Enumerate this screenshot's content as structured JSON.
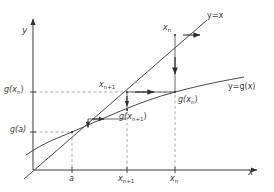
{
  "figure": {
    "type": "cobweb-diagram",
    "axes": {
      "x_axis_label": "x",
      "y_axis_label": "y",
      "origin": {
        "x": 33,
        "y": 170
      },
      "x_axis_end": {
        "x": 262,
        "y": 170
      },
      "y_axis_end": {
        "x": 33,
        "y": 14
      }
    },
    "curves": [
      {
        "name": "identity-line",
        "label": "y=x",
        "label_position": {
          "x": 211,
          "y": 13
        },
        "from": {
          "x": 24,
          "y": 179
        },
        "to": {
          "x": 206,
          "y": 21
        },
        "style": "solid"
      },
      {
        "name": "g-curve",
        "label": "y=g(x)",
        "label_position": {
          "x": 229,
          "y": 84
        },
        "style": "solid-curved"
      }
    ],
    "points": [
      {
        "name": "fixed-point-a",
        "x": 72,
        "y": 132
      },
      {
        "name": "point-xn-on-identity",
        "x": 175,
        "y": 35
      },
      {
        "name": "point-xn-plus-1-on-identity",
        "x": 127,
        "y": 92
      },
      {
        "name": "point-g-xn",
        "x": 175,
        "y": 92
      },
      {
        "name": "point-g-xn-plus-1",
        "x": 127,
        "y": 110
      }
    ],
    "labels": {
      "y_axis": "y",
      "x_axis": "x",
      "g_xn_on_y_axis": "g(x",
      "g_xn_on_y_axis_sub": "n",
      "g_xn_on_y_axis_tail": ")",
      "g_a_on_y_axis": "g(a)",
      "a_on_x_axis": "a",
      "x_n_plus_1_on_x_axis": "x",
      "x_n_plus_1_on_x_axis_sub": "n+1",
      "x_n_on_x_axis": "x",
      "x_n_on_x_axis_sub": "n",
      "x_n_top": "x",
      "x_n_top_sub": "n",
      "x_n_plus_1_mid": "x",
      "x_n_plus_1_mid_sub": "n+1",
      "g_xn_right": "g(x",
      "g_xn_right_sub": "n",
      "g_xn_right_tail": ")",
      "g_xn_plus_1_mid": "g(x",
      "g_xn_plus_1_mid_sub": "n+1",
      "g_xn_plus_1_mid_tail": ")",
      "identity_line": "y=x",
      "g_curve": "y=g(x)"
    },
    "arrows": [
      {
        "name": "arrow-right-top",
        "direction": "right",
        "from": {
          "x": 182,
          "y": 35
        },
        "to": {
          "x": 203,
          "y": 35
        }
      },
      {
        "name": "arrow-down-xn",
        "direction": "down",
        "from": {
          "x": 175,
          "y": 58
        },
        "to": {
          "x": 175,
          "y": 80
        }
      },
      {
        "name": "arrow-right-mid",
        "direction": "right",
        "from": {
          "x": 133,
          "y": 92
        },
        "to": {
          "x": 156,
          "y": 92
        }
      },
      {
        "name": "arrow-down-mid",
        "direction": "down",
        "from": {
          "x": 127,
          "y": 97
        },
        "to": {
          "x": 127,
          "y": 110
        }
      },
      {
        "name": "arrow-right-small",
        "direction": "right",
        "from": {
          "x": 92,
          "y": 119
        },
        "to": {
          "x": 104,
          "y": 119
        }
      },
      {
        "name": "arrow-down-small",
        "direction": "down",
        "from": {
          "x": 88,
          "y": 122
        },
        "to": {
          "x": 88,
          "y": 130
        }
      }
    ],
    "colors": {
      "line": "#4a4a4a",
      "axis": "#3a3a3a",
      "dashed": "#9a9a9a",
      "text": "#3a3a3a",
      "background": "#fefefe"
    }
  }
}
